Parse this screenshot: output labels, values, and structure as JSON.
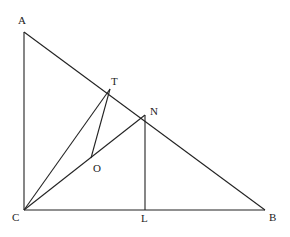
{
  "diagram": {
    "points": {
      "A": {
        "label": "A",
        "x": 24,
        "y": 32
      },
      "T": {
        "label": "T",
        "x": 110,
        "y": 89
      },
      "N": {
        "label": "N",
        "x": 145,
        "y": 115
      },
      "O": {
        "label": "O",
        "x": 91,
        "y": 158
      },
      "C": {
        "label": "C",
        "x": 24,
        "y": 210
      },
      "L": {
        "label": "L",
        "x": 145,
        "y": 210
      },
      "B": {
        "label": "B",
        "x": 265,
        "y": 210
      }
    },
    "segments": [
      "AC",
      "AB",
      "CB",
      "CT",
      "CN",
      "TO",
      "NL"
    ]
  }
}
